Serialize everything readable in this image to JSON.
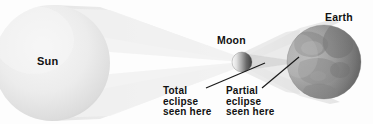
{
  "diagram": {
    "background_color": "#fdfdfd",
    "width": 373,
    "height": 124
  },
  "bodies": {
    "sun": {
      "label": "Sun",
      "cx": 52,
      "cy": 63,
      "r": 58,
      "fill_light": "#f2f2f2",
      "fill_mid": "#dedede",
      "fill_edge": "#cfcfcf"
    },
    "moon": {
      "label": "Moon",
      "cx": 242,
      "cy": 62,
      "r": 10,
      "fill_lit": "#f0f0f0",
      "fill_dark": "#4a4a4a"
    },
    "earth": {
      "label": "Earth",
      "cx": 324,
      "cy": 62,
      "r": 37,
      "fill_lit": "#b0b0b0",
      "fill_dark": "#6e6e6e",
      "fill_terrain": "#9a9a9a"
    }
  },
  "rays": {
    "penumbra_color": "#ededed",
    "penumbra_color_soft": "#f4f4f4",
    "umbra_color": "#c8c8c8"
  },
  "annotations": [
    {
      "name": "total-eclipse",
      "lines": [
        "Total",
        "eclipse",
        "seen here"
      ],
      "text": "Total\neclipse\nseen here",
      "leader": {
        "x1": 206,
        "y1": 88,
        "x2": 265,
        "y2": 63
      }
    },
    {
      "name": "partial-eclipse",
      "lines": [
        "Partial",
        "eclipse",
        "seen here"
      ],
      "text": "Partial\neclipse\nseen here",
      "leader": {
        "x1": 262,
        "y1": 88,
        "x2": 299,
        "y2": 57
      }
    }
  ],
  "leader_line_color": "#1a1a1a",
  "text_color": "#111111"
}
